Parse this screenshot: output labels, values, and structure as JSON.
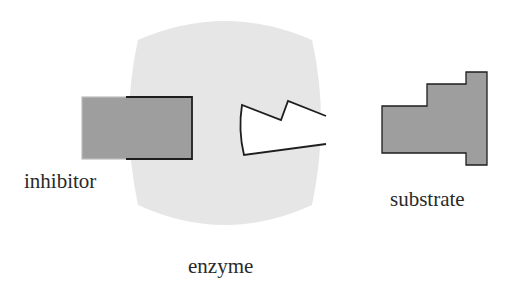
{
  "labels": {
    "inhibitor": "inhibitor",
    "substrate": "substrate",
    "enzyme": "enzyme"
  },
  "colors": {
    "background": "#ffffff",
    "enzyme_fill": "#e6e6e6",
    "molecule_fill": "#9e9e9e",
    "outline": "#1e1e1e",
    "active_site_fill": "#ffffff"
  }
}
